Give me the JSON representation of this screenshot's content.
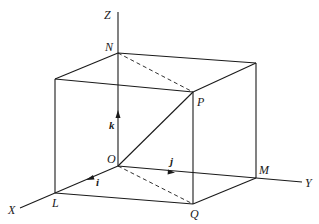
{
  "diagram": {
    "type": "3d-coordinate-box",
    "axes": {
      "x_label": "X",
      "y_label": "Y",
      "z_label": "Z"
    },
    "points": {
      "origin": "O",
      "L": "L",
      "M": "M",
      "N": "N",
      "P": "P",
      "Q": "Q"
    },
    "unit_vectors": {
      "i": "i",
      "j": "j",
      "k": "k"
    },
    "colors": {
      "stroke": "#1a1a1a",
      "background": "#ffffff"
    }
  }
}
